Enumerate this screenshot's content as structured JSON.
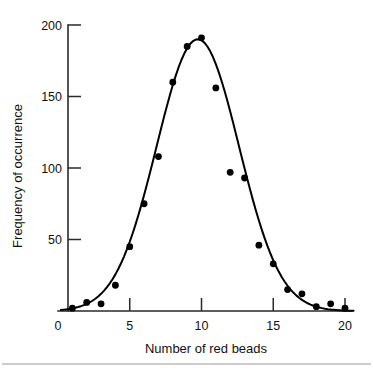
{
  "chart_data": {
    "type": "scatter",
    "title": "",
    "subtitle": "",
    "xlabel": "Number of red beads",
    "ylabel": "Frequency of occurrence",
    "xlim": [
      0,
      20
    ],
    "ylim": [
      0,
      200
    ],
    "xticks": [
      0,
      5,
      10,
      15,
      20
    ],
    "xtick_labels": [
      "0",
      "5",
      "10",
      "15",
      "20"
    ],
    "yticks": [
      0,
      50,
      100,
      150,
      200
    ],
    "ytick_labels": [
      "0",
      "50",
      "100",
      "150",
      "200"
    ],
    "grid": false,
    "legend": false,
    "legend_position": "none",
    "marker": "filled-circle",
    "marker_color": "#000000",
    "curve_color": "#000000",
    "axis_color": "#2a2a2a",
    "background_color": "#ffffff",
    "has_fitted_curve": true,
    "fitted_curve_note": "smooth bell-shaped (normal/binomial) curve through points",
    "x": [
      1,
      2,
      3,
      4,
      5,
      6,
      7,
      8,
      9,
      10,
      11,
      12,
      13,
      14,
      15,
      16,
      17,
      18,
      19,
      20
    ],
    "values": [
      2,
      6,
      5,
      18,
      45,
      75,
      108,
      160,
      185,
      191,
      156,
      97,
      93,
      46,
      33,
      15,
      12,
      3,
      5,
      2
    ],
    "series": [
      {
        "name": "Frequency of occurrence",
        "values": [
          2,
          6,
          5,
          18,
          45,
          75,
          108,
          160,
          185,
          191,
          156,
          97,
          93,
          46,
          33,
          15,
          12,
          3,
          5,
          2
        ]
      }
    ]
  },
  "figure": {
    "caption": "",
    "footer_rule": true
  }
}
